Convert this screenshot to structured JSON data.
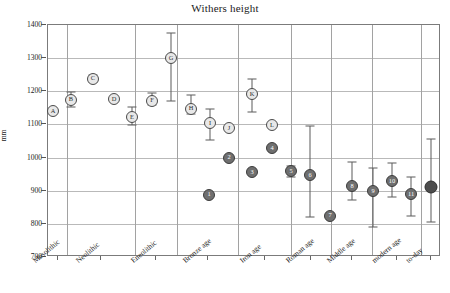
{
  "chart_data": {
    "type": "scatter",
    "title": "Withers height",
    "xlabel": "",
    "ylabel": "mm",
    "ylim": [
      700,
      1400
    ],
    "yticks": [
      1400,
      1300,
      1200,
      1100,
      1000,
      900,
      800,
      700
    ],
    "grid": true,
    "legend": "none",
    "categories": [
      "Mesolithic",
      "Neolithic",
      "Eneolithic",
      "Bronze age",
      "Iron age",
      "Roman age",
      "Middle age",
      "modern age",
      "to-day"
    ],
    "points": [
      {
        "label": "A",
        "category": "Mesolithic",
        "x": 52,
        "value": 1140,
        "low": null,
        "high": null,
        "style": "open"
      },
      {
        "label": "B",
        "category": "Neolithic",
        "x": 70,
        "value": 1175,
        "low": 1152,
        "high": 1197,
        "style": "open"
      },
      {
        "label": "C",
        "category": "Neolithic",
        "x": 92,
        "value": 1238,
        "low": 1228,
        "high": 1248,
        "style": "open"
      },
      {
        "label": "D",
        "category": "Neolithic",
        "x": 113,
        "value": 1177,
        "low": null,
        "high": null,
        "style": "open"
      },
      {
        "label": "E",
        "category": "Neolithic",
        "x": 131,
        "value": 1122,
        "low": 1097,
        "high": 1152,
        "style": "open"
      },
      {
        "label": "F",
        "category": "Neolithic",
        "x": 151,
        "value": 1172,
        "low": 1160,
        "high": 1196,
        "style": "open"
      },
      {
        "label": "G",
        "category": "Eneolithic",
        "x": 170,
        "value": 1300,
        "low": 1170,
        "high": 1375,
        "style": "open"
      },
      {
        "label": "H",
        "category": "Bronze age",
        "x": 190,
        "value": 1148,
        "low": 1130,
        "high": 1190,
        "style": "open"
      },
      {
        "label": "I",
        "category": "Bronze age",
        "x": 209,
        "value": 1105,
        "low": 1052,
        "high": 1148,
        "style": "open"
      },
      {
        "label": "J",
        "category": "Bronze age",
        "x": 228,
        "value": 1088,
        "low": null,
        "high": null,
        "style": "open"
      },
      {
        "label": "2",
        "category": "Bronze age",
        "x": 228,
        "value": 1000,
        "low": null,
        "high": null,
        "style": "fill"
      },
      {
        "label": "1",
        "category": "Bronze age",
        "x": 208,
        "value": 888,
        "low": null,
        "high": null,
        "style": "fill"
      },
      {
        "label": "K",
        "category": "Iron age",
        "x": 251,
        "value": 1192,
        "low": 1138,
        "high": 1238,
        "style": "open"
      },
      {
        "label": "L",
        "category": "Iron age",
        "x": 271,
        "value": 1098,
        "low": null,
        "high": null,
        "style": "open"
      },
      {
        "label": "4",
        "category": "Iron age",
        "x": 271,
        "value": 1028,
        "low": null,
        "high": null,
        "style": "fill"
      },
      {
        "label": "3",
        "category": "Iron age",
        "x": 251,
        "value": 955,
        "low": null,
        "high": null,
        "style": "fill"
      },
      {
        "label": "5",
        "category": "Roman age",
        "x": 290,
        "value": 960,
        "low": 940,
        "high": 975,
        "style": "fill"
      },
      {
        "label": "6",
        "category": "Roman age",
        "x": 309,
        "value": 948,
        "low": 822,
        "high": 1096,
        "style": "fill"
      },
      {
        "label": "7",
        "category": "Roman age",
        "x": 329,
        "value": 825,
        "low": null,
        "high": null,
        "style": "fill"
      },
      {
        "label": "8",
        "category": "Middle age",
        "x": 351,
        "value": 913,
        "low": 872,
        "high": 987,
        "style": "fill"
      },
      {
        "label": "9",
        "category": "modern age",
        "x": 372,
        "value": 900,
        "low": 792,
        "high": 968,
        "style": "fill"
      },
      {
        "label": "10",
        "category": "modern age",
        "x": 391,
        "value": 928,
        "low": 880,
        "high": 985,
        "style": "fill"
      },
      {
        "label": "11",
        "category": "modern age",
        "x": 410,
        "value": 890,
        "low": 825,
        "high": 940,
        "style": "fill"
      },
      {
        "label": "",
        "category": "to-day",
        "x": 430,
        "value": 912,
        "low": 805,
        "high": 1056,
        "style": "dark"
      }
    ],
    "category_boundaries": [
      66,
      134,
      176,
      237,
      290,
      330,
      371,
      420
    ]
  }
}
